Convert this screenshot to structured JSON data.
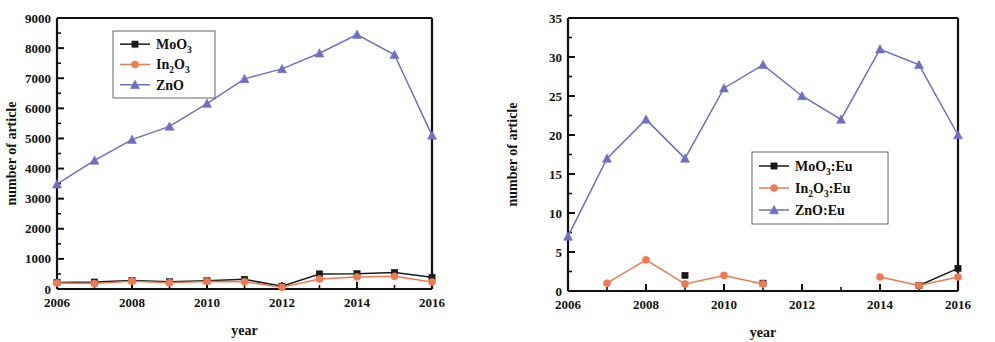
{
  "figure": {
    "panels": [
      "left",
      "right"
    ],
    "background": "#ffffff"
  },
  "colors": {
    "mo": "#1a1a1a",
    "in": "#ee7a52",
    "zn": "#6f6fc0",
    "axis": "#111111"
  },
  "left": {
    "ylabel": "number of article",
    "xlabel": "year",
    "ytick_labels": [
      "0",
      "1000",
      "2000",
      "3000",
      "4000",
      "5000",
      "6000",
      "7000",
      "8000",
      "9000"
    ],
    "xtick_labels": [
      "2006",
      "2008",
      "2010",
      "2012",
      "2014",
      "2016"
    ],
    "legend": [
      {
        "label_main": "MoO",
        "label_sub": "3",
        "label_tail": "",
        "marker": "square",
        "color": "#1a1a1a",
        "name": "MoO3"
      },
      {
        "label_main": "In",
        "label_sub": "2",
        "label_mid": "O",
        "label_sub2": "3",
        "label_tail": "",
        "marker": "circle",
        "color": "#ee7a52",
        "name": "In2O3"
      },
      {
        "label_main": "ZnO",
        "label_sub": "",
        "label_tail": "",
        "marker": "triangle",
        "color": "#6f6fc0",
        "name": "ZnO"
      }
    ]
  },
  "right": {
    "ylabel": "number of article",
    "xlabel": "year",
    "ytick_labels": [
      "0",
      "5",
      "10",
      "15",
      "20",
      "25",
      "30",
      "35"
    ],
    "xtick_labels": [
      "2006",
      "2008",
      "2010",
      "2012",
      "2014",
      "2016"
    ],
    "legend": [
      {
        "label_main": "MoO",
        "label_sub": "3",
        "label_tail": ":Eu",
        "marker": "square",
        "color": "#1a1a1a",
        "name": "MoO3:Eu"
      },
      {
        "label_main": "In",
        "label_sub": "2",
        "label_mid": "O",
        "label_sub2": "3",
        "label_tail": ":Eu",
        "marker": "circle",
        "color": "#ee7a52",
        "name": "In2O3:Eu"
      },
      {
        "label_main": "ZnO",
        "label_sub": "",
        "label_tail": ":Eu",
        "marker": "triangle",
        "color": "#6f6fc0",
        "name": "ZnO:Eu"
      }
    ]
  },
  "chart_data": [
    {
      "type": "line",
      "panel": "left",
      "title": "",
      "xlabel": "year",
      "ylabel": "number of article",
      "x": [
        2006,
        2007,
        2008,
        2009,
        2010,
        2011,
        2012,
        2013,
        2014,
        2015,
        2016
      ],
      "xlim": [
        2006,
        2016
      ],
      "ylim": [
        0,
        9000
      ],
      "yticks": [
        0,
        1000,
        2000,
        3000,
        4000,
        5000,
        6000,
        7000,
        8000,
        9000
      ],
      "xticks": [
        2006,
        2008,
        2010,
        2012,
        2014,
        2016
      ],
      "grid": false,
      "legend_position": "upper-left-inset",
      "series": [
        {
          "name": "MoO3",
          "color": "#1a1a1a",
          "marker": "square",
          "values": [
            220,
            230,
            280,
            240,
            270,
            320,
            90,
            500,
            510,
            550,
            390
          ]
        },
        {
          "name": "In2O3",
          "color": "#ee7a52",
          "marker": "circle",
          "values": [
            200,
            180,
            260,
            210,
            250,
            240,
            60,
            330,
            400,
            420,
            230
          ]
        },
        {
          "name": "ZnO",
          "color": "#6f6fc0",
          "marker": "triangle",
          "values": [
            3480,
            4270,
            4960,
            5400,
            6160,
            6980,
            7310,
            7830,
            8450,
            7780,
            5100
          ]
        }
      ]
    },
    {
      "type": "line",
      "panel": "right",
      "title": "",
      "xlabel": "year",
      "ylabel": "number of article",
      "x": [
        2006,
        2007,
        2008,
        2009,
        2010,
        2011,
        2012,
        2013,
        2014,
        2015,
        2016
      ],
      "xlim": [
        2006,
        2016
      ],
      "ylim": [
        0,
        35
      ],
      "yticks": [
        0,
        5,
        10,
        15,
        20,
        25,
        30,
        35
      ],
      "xticks": [
        2006,
        2008,
        2010,
        2012,
        2014,
        2016
      ],
      "grid": false,
      "legend_position": "lower-right-inset",
      "series": [
        {
          "name": "MoO3:Eu",
          "color": "#1a1a1a",
          "marker": "square",
          "values": [
            null,
            null,
            null,
            2,
            null,
            1,
            null,
            null,
            null,
            0.7,
            2.9
          ]
        },
        {
          "name": "In2O3:Eu",
          "color": "#ee7a52",
          "marker": "circle",
          "values": [
            null,
            1,
            4,
            0.9,
            2,
            0.9,
            null,
            null,
            1.8,
            0.7,
            1.8
          ]
        },
        {
          "name": "ZnO:Eu",
          "color": "#6f6fc0",
          "marker": "triangle",
          "values": [
            7,
            17,
            22,
            17,
            26,
            29,
            25,
            22,
            31,
            29,
            20
          ]
        }
      ]
    }
  ]
}
